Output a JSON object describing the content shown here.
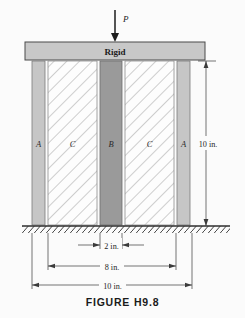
{
  "figure": {
    "caption": "FIGURE H9.8",
    "load_label": "P",
    "plate_label": "Rigid"
  },
  "members": [
    {
      "id": "A-left",
      "label": "A",
      "x": 32,
      "width": 13,
      "kind": "solid-light",
      "label_x": 38.5
    },
    {
      "id": "C-left",
      "label": "C",
      "x": 48,
      "width": 49,
      "kind": "hatched",
      "label_x": 72.5
    },
    {
      "id": "B-center",
      "label": "B",
      "x": 100,
      "width": 22,
      "kind": "solid-dark",
      "label_x": 111
    },
    {
      "id": "C-right",
      "label": "C",
      "x": 125,
      "width": 49,
      "kind": "hatched",
      "label_x": 149.5
    },
    {
      "id": "A-right",
      "label": "A",
      "x": 177,
      "width": 13,
      "kind": "solid-light",
      "label_x": 183.5
    }
  ],
  "dimensions": {
    "height": {
      "label": "10 in.",
      "x": 206,
      "y_top": 61,
      "y_bottom": 226
    },
    "width_inner": {
      "label": "2 in.",
      "x_from": 100,
      "x_to": 122,
      "y": 245,
      "arrow_dir": "outward"
    },
    "width_mid": {
      "label": "8 in.",
      "x_from": 48,
      "x_to": 176,
      "y": 266,
      "arrow_dir": "inward"
    },
    "width_outer": {
      "label": "10 in.",
      "x_from": 32,
      "x_to": 192,
      "y": 285,
      "arrow_dir": "inward"
    }
  },
  "geometry": {
    "plate": {
      "x": 25,
      "y": 42,
      "width": 180,
      "height": 18
    },
    "columns_top": 61,
    "columns_bottom": 225,
    "ground_y": 226,
    "ground_x": 22,
    "ground_width": 208,
    "ground_hatch_height": 7,
    "arrow_x": 115,
    "arrow_y_top": 10,
    "arrow_y_bottom": 41
  },
  "colors": {
    "paper": "#fbfbfb",
    "plate_fill": "#c8c8c8",
    "plate_stroke": "#4a4a4a",
    "light_member_fill": "#c6c6c6",
    "dark_member_fill": "#9a9a9a",
    "hatch_fill": "#fdfdfd",
    "hatch_stroke": "#a8a8a8",
    "outline": "#5a5a5a",
    "dim_line": "#3b3b3b",
    "ground": "#2e2e2e"
  },
  "extension_lines": [
    {
      "x": 32,
      "y_from": 228,
      "y_to": 288
    },
    {
      "x": 48,
      "y_from": 228,
      "y_to": 269
    },
    {
      "x": 100,
      "y_from": 228,
      "y_to": 248
    },
    {
      "x": 122,
      "y_from": 228,
      "y_to": 248
    },
    {
      "x": 176,
      "y_from": 228,
      "y_to": 269
    },
    {
      "x": 192,
      "y_from": 228,
      "y_to": 288
    }
  ]
}
